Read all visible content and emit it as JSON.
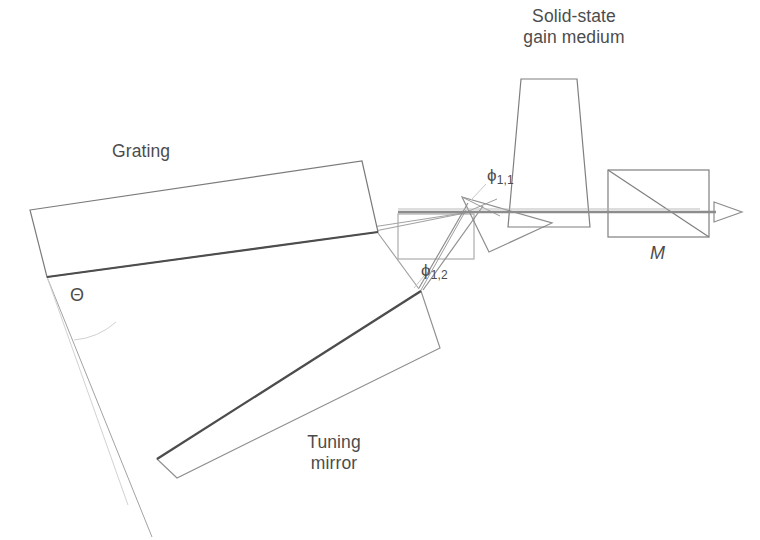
{
  "figure": {
    "background_color": "#ffffff",
    "ink_color": "#4c4c4c",
    "beam_color": "#7a7a7a"
  },
  "labels": {
    "gain_medium_line1": "Solid-state",
    "gain_medium_line2": "gain medium",
    "grating": "Grating",
    "tuning_mirror_line1": "Tuning",
    "tuning_mirror_line2": "mirror",
    "theta": "Θ",
    "phi_1_1_base": "ϕ",
    "phi_1_1_sub": "1,1",
    "phi_1_2_base": "ϕ",
    "phi_1_2_sub": "1,2",
    "output_mirror": "M"
  },
  "components": {
    "grating": {
      "name": "grating",
      "shape": "tilted-rectangle",
      "outline_points": "30,210 362,161 378,232 47,277",
      "surface_line": "47,277 378,232",
      "stroke": "#6b6b6b",
      "surface_stroke": "#4a4a4a"
    },
    "tuning_mirror": {
      "name": "tuning-mirror",
      "shape": "tilted-rectangle",
      "outline_points": "421,291 437,344 174,472 156,460",
      "surface_line": "421,291 156,460",
      "stroke": "#8a8a8a",
      "surface_stroke": "#4a4a4a"
    },
    "beam_expander_box": {
      "name": "beam-expander",
      "shape": "rectangle",
      "x": 398,
      "y": 214,
      "width": 76,
      "height": 45,
      "stroke": "#9a9a9a"
    },
    "prism": {
      "name": "prism",
      "shape": "triangle",
      "points": "462,196 551,222 488,251",
      "stroke": "#8d8d8d"
    },
    "gain_medium": {
      "name": "gain-medium",
      "shape": "trapezoid",
      "points": "520,79 576,79 589,226 509,226",
      "stroke": "#7d7d7d"
    },
    "output_mirror": {
      "name": "output-mirror-M",
      "shape": "rectangle-with-diagonal",
      "x": 608,
      "y": 170,
      "width": 101,
      "height": 67,
      "diagonal": "608,170 709,237",
      "stroke": "#7d7d7d"
    },
    "output_arrow": {
      "name": "output-beam-arrow",
      "shape": "open-triangle",
      "points": "716,203 741,212 716,221",
      "stroke": "#8a8a8a"
    }
  },
  "beams": {
    "main_axis": {
      "name": "main-cavity-axis",
      "path": "398,212 740,212",
      "stroke": "#8c8c8c",
      "width": 2.6
    },
    "grating_to_axis": {
      "name": "grating-lower-beam",
      "path": "47,277 470,212",
      "stroke": "#9e9e9e",
      "width": 1.1
    },
    "grating_upper_beam": {
      "name": "grating-upper-beam",
      "path": "362,232 470,212",
      "stroke": "#9e9e9e",
      "width": 1.1
    },
    "diffracted_to_tuning_1": {
      "name": "diffracted-beam-upper",
      "path": "470,206 420,288",
      "stroke": "#8f8f8f",
      "width": 1.2
    },
    "diffracted_to_tuning_2": {
      "name": "diffracted-beam-lower",
      "path": "482,207 422,290",
      "stroke": "#8f8f8f",
      "width": 1.2
    },
    "tuning_return": {
      "name": "tuning-mirror-return-beam",
      "path": "420,289 380,232",
      "stroke": "#9a9a9a",
      "width": 1.1
    },
    "theta_reference": {
      "name": "theta-reference-line",
      "path": "47,277 150,535",
      "stroke": "#a9a9a9",
      "width": 1.0
    },
    "theta_guide": {
      "name": "theta-guide-line",
      "path": "47,277 135,500",
      "stroke": "#cfcfcf",
      "width": 1.0
    },
    "theta_arc": {
      "name": "theta-arc",
      "stroke": "#cccccc"
    }
  }
}
